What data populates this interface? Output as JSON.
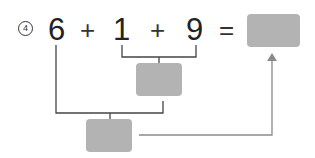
{
  "problem": {
    "number_label": "4",
    "operands": [
      "6",
      "1",
      "9"
    ],
    "operators": [
      "+",
      "+"
    ],
    "equals": "="
  },
  "boxes": {
    "answer": {
      "label": ""
    },
    "partial_sum_1_9": {
      "label": ""
    },
    "partial_sum_6_10": {
      "label": ""
    }
  },
  "colors": {
    "box_fill": "#b3b3b3",
    "line": "#444444",
    "arrow": "#8a8a8a"
  }
}
